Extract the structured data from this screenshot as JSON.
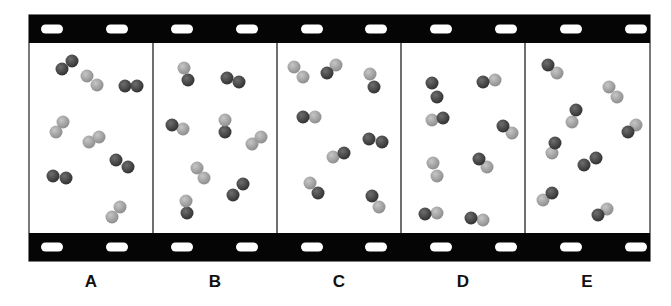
{
  "figure": {
    "strip": {
      "x": 29,
      "y": 15,
      "width": 621,
      "height": 246,
      "bar_height": 28,
      "bar_color": "#050505",
      "frame_bg": "#ffffff",
      "divider_color": "#222222"
    },
    "sprocket_holes_x": [
      52,
      117,
      182,
      247,
      312,
      376,
      441,
      506,
      571,
      636
    ],
    "atom_radius": 6.5,
    "colors": {
      "dark": "#3b3b3b",
      "dark_highlight": "#707070",
      "light": "#9c9c9c",
      "light_highlight": "#c8c8c8"
    },
    "frames": [
      {
        "label": "A",
        "x": 29,
        "label_x": 91,
        "molecules": [
          {
            "atoms": [
              [
                62,
                69,
                "dark"
              ],
              [
                72,
                61,
                "dark"
              ]
            ]
          },
          {
            "atoms": [
              [
                87,
                76,
                "light"
              ],
              [
                97,
                85,
                "light"
              ]
            ]
          },
          {
            "atoms": [
              [
                125,
                86,
                "dark"
              ],
              [
                137,
                86,
                "dark"
              ]
            ]
          },
          {
            "atoms": [
              [
                56,
                132,
                "light"
              ],
              [
                63,
                122,
                "light"
              ]
            ]
          },
          {
            "atoms": [
              [
                89,
                142,
                "light"
              ],
              [
                99,
                137,
                "light"
              ]
            ]
          },
          {
            "atoms": [
              [
                116,
                160,
                "dark"
              ],
              [
                128,
                167,
                "dark"
              ]
            ]
          },
          {
            "atoms": [
              [
                53,
                176,
                "dark"
              ],
              [
                66,
                178,
                "dark"
              ]
            ]
          },
          {
            "atoms": [
              [
                112,
                217,
                "light"
              ],
              [
                120,
                207,
                "light"
              ]
            ]
          }
        ]
      },
      {
        "label": "B",
        "x": 153,
        "label_x": 215,
        "molecules": [
          {
            "atoms": [
              [
                188,
                80,
                "dark"
              ],
              [
                184,
                68,
                "light"
              ]
            ]
          },
          {
            "atoms": [
              [
                227,
                78,
                "dark"
              ],
              [
                239,
                82,
                "dark"
              ]
            ]
          },
          {
            "atoms": [
              [
                183,
                129,
                "light"
              ],
              [
                172,
                125,
                "dark"
              ]
            ]
          },
          {
            "atoms": [
              [
                225,
                132,
                "dark"
              ],
              [
                225,
                120,
                "light"
              ]
            ]
          },
          {
            "atoms": [
              [
                252,
                144,
                "light"
              ],
              [
                261,
                137,
                "light"
              ]
            ]
          },
          {
            "atoms": [
              [
                197,
                168,
                "light"
              ],
              [
                204,
                178,
                "light"
              ]
            ]
          },
          {
            "atoms": [
              [
                233,
                195,
                "dark"
              ],
              [
                243,
                184,
                "dark"
              ]
            ]
          },
          {
            "atoms": [
              [
                187,
                213,
                "dark"
              ],
              [
                186,
                201,
                "light"
              ]
            ]
          }
        ]
      },
      {
        "label": "C",
        "x": 277,
        "label_x": 339,
        "molecules": [
          {
            "atoms": [
              [
                294,
                67,
                "light"
              ],
              [
                303,
                77,
                "light"
              ]
            ]
          },
          {
            "atoms": [
              [
                336,
                65,
                "light"
              ],
              [
                327,
                73,
                "dark"
              ]
            ]
          },
          {
            "atoms": [
              [
                374,
                87,
                "dark"
              ],
              [
                370,
                74,
                "light"
              ]
            ]
          },
          {
            "atoms": [
              [
                315,
                117,
                "light"
              ],
              [
                303,
                117,
                "dark"
              ]
            ]
          },
          {
            "atoms": [
              [
                333,
                157,
                "light"
              ],
              [
                344,
                153,
                "dark"
              ]
            ]
          },
          {
            "atoms": [
              [
                369,
                139,
                "dark"
              ],
              [
                382,
                142,
                "dark"
              ]
            ]
          },
          {
            "atoms": [
              [
                318,
                193,
                "dark"
              ],
              [
                310,
                183,
                "light"
              ]
            ]
          },
          {
            "atoms": [
              [
                379,
                207,
                "light"
              ],
              [
                372,
                196,
                "dark"
              ]
            ]
          }
        ]
      },
      {
        "label": "D",
        "x": 401,
        "label_x": 463,
        "molecules": [
          {
            "atoms": [
              [
                432,
                83,
                "dark"
              ],
              [
                437,
                97,
                "dark"
              ]
            ]
          },
          {
            "atoms": [
              [
                495,
                80,
                "light"
              ],
              [
                483,
                82,
                "dark"
              ]
            ]
          },
          {
            "atoms": [
              [
                432,
                120,
                "light"
              ],
              [
                443,
                118,
                "dark"
              ]
            ]
          },
          {
            "atoms": [
              [
                512,
                133,
                "light"
              ],
              [
                503,
                126,
                "dark"
              ]
            ]
          },
          {
            "atoms": [
              [
                433,
                163,
                "light"
              ],
              [
                437,
                176,
                "light"
              ]
            ]
          },
          {
            "atoms": [
              [
                487,
                167,
                "light"
              ],
              [
                479,
                159,
                "dark"
              ]
            ]
          },
          {
            "atoms": [
              [
                437,
                213,
                "light"
              ],
              [
                425,
                214,
                "dark"
              ]
            ]
          },
          {
            "atoms": [
              [
                483,
                220,
                "light"
              ],
              [
                471,
                218,
                "dark"
              ]
            ]
          }
        ]
      },
      {
        "label": "E",
        "x": 525,
        "label_x": 587,
        "molecules": [
          {
            "atoms": [
              [
                557,
                73,
                "light"
              ],
              [
                548,
                65,
                "dark"
              ]
            ]
          },
          {
            "atoms": [
              [
                609,
                87,
                "light"
              ],
              [
                617,
                97,
                "light"
              ]
            ]
          },
          {
            "atoms": [
              [
                572,
                122,
                "light"
              ],
              [
                576,
                110,
                "dark"
              ]
            ]
          },
          {
            "atoms": [
              [
                636,
                125,
                "light"
              ],
              [
                628,
                132,
                "dark"
              ]
            ]
          },
          {
            "atoms": [
              [
                552,
                153,
                "light"
              ],
              [
                555,
                143,
                "dark"
              ]
            ]
          },
          {
            "atoms": [
              [
                584,
                165,
                "dark"
              ],
              [
                596,
                158,
                "dark"
              ]
            ]
          },
          {
            "atoms": [
              [
                543,
                200,
                "light"
              ],
              [
                552,
                193,
                "dark"
              ]
            ]
          },
          {
            "atoms": [
              [
                607,
                209,
                "light"
              ],
              [
                598,
                215,
                "dark"
              ]
            ]
          }
        ]
      }
    ]
  }
}
